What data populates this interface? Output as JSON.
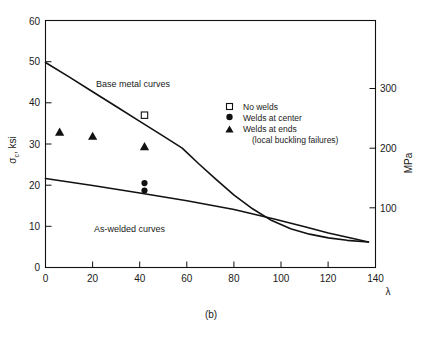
{
  "figure": {
    "caption": "(b)",
    "xlabel": "λ",
    "ylabel_left": "σ",
    "ylabel_left_sub": "c",
    "ylabel_left_unit": ", ksi",
    "ylabel_right": "MPa"
  },
  "legend": {
    "items": [
      {
        "marker": "open-square-marker",
        "label": "No welds"
      },
      {
        "marker": "filled-circle-marker",
        "label": "Welds at center"
      },
      {
        "marker": "filled-triangle-marker",
        "label": "Welds at ends"
      }
    ],
    "note": "(local buckling failures)"
  },
  "annotations": {
    "base_metal": "Base metal curves",
    "as_welded": "As-welded curves"
  },
  "axes": {
    "x_ticks": [
      "0",
      "20",
      "40",
      "60",
      "80",
      "100",
      "120",
      "140"
    ],
    "y_ticks_left": [
      "0",
      "10",
      "20",
      "30",
      "40",
      "50",
      "60"
    ],
    "y_ticks_right": [
      "100",
      "200",
      "300"
    ]
  },
  "chart_data": {
    "type": "line",
    "title": "",
    "xlabel": "λ",
    "ylabel": "σc, ksi",
    "ylabel_secondary": "MPa",
    "xlim": [
      0,
      140
    ],
    "ylim": [
      0,
      60
    ],
    "ylim_secondary": [
      0,
      413.7
    ],
    "grid": false,
    "legend_position": "upper-right-inside",
    "series": [
      {
        "name": "Base metal curves",
        "type": "line",
        "points": [
          [
            0,
            49.8
          ],
          [
            10,
            46.3
          ],
          [
            20,
            42.7
          ],
          [
            30,
            39.1
          ],
          [
            40,
            35.5
          ],
          [
            50,
            31.9
          ],
          [
            58,
            29.0
          ],
          [
            65,
            25.2
          ],
          [
            72,
            21.6
          ],
          [
            80,
            17.6
          ],
          [
            88,
            14.2
          ],
          [
            96,
            11.4
          ],
          [
            104,
            9.4
          ],
          [
            112,
            8.1
          ],
          [
            120,
            7.2
          ],
          [
            128,
            6.6
          ],
          [
            137,
            6.2
          ]
        ]
      },
      {
        "name": "As-welded curves",
        "type": "line",
        "points": [
          [
            0,
            21.6
          ],
          [
            20,
            19.9
          ],
          [
            40,
            18.1
          ],
          [
            60,
            16.2
          ],
          [
            80,
            14.1
          ],
          [
            97,
            11.8
          ],
          [
            110,
            9.9
          ],
          [
            120,
            8.4
          ],
          [
            130,
            7.1
          ],
          [
            137,
            6.2
          ]
        ]
      }
    ],
    "scatter_groups": [
      {
        "name": "No welds",
        "marker": "open-square",
        "points": [
          [
            42,
            37.0
          ]
        ]
      },
      {
        "name": "Welds at center",
        "marker": "filled-circle",
        "points": [
          [
            42,
            20.5
          ],
          [
            42,
            18.7
          ]
        ]
      },
      {
        "name": "Welds at ends (local buckling failures)",
        "marker": "filled-triangle",
        "points": [
          [
            6,
            33.0
          ],
          [
            20,
            32.0
          ],
          [
            42,
            29.5
          ]
        ]
      }
    ]
  }
}
